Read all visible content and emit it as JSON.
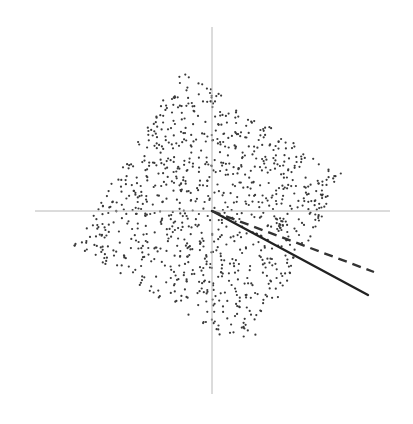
{
  "chart_data": {
    "type": "scatter",
    "title": "",
    "xlabel": "",
    "ylabel": "",
    "grid": false,
    "legend": null,
    "axes": {
      "origin_px": [
        212,
        211
      ],
      "x_axis_px": [
        35,
        390
      ],
      "y_axis_px": [
        27,
        394
      ],
      "color": "#b8b8b8"
    },
    "point_cloud": {
      "shape": "rotated-square",
      "vertices_px": [
        [
          182,
          70
        ],
        [
          345,
          176
        ],
        [
          248,
          352
        ],
        [
          73,
          245
        ]
      ],
      "count": 1000,
      "seed": 7,
      "radius": 1.1,
      "color": "#3a3a3a"
    },
    "lines": [
      {
        "name": "solid-direction",
        "style": "solid",
        "from_px": [
          212,
          211
        ],
        "to_px": [
          368,
          295
        ],
        "width": 2.4,
        "color": "#222222"
      },
      {
        "name": "dashed-direction",
        "style": "dashed",
        "from_px": [
          212,
          211
        ],
        "to_px": [
          374,
          272
        ],
        "width": 2.4,
        "color": "#333333"
      }
    ]
  }
}
